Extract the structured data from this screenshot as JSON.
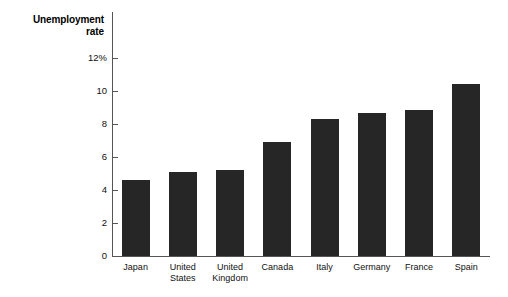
{
  "chart_data": {
    "type": "bar",
    "title": "Unemployment rate",
    "title_lines": "Unemployment\nrate",
    "xlabel": "",
    "ylabel": "Unemployment rate",
    "unit": "%",
    "grid": false,
    "legend": "none",
    "ylim": [
      0,
      12
    ],
    "ytick_values": [
      12,
      10,
      8,
      6,
      4,
      2,
      0
    ],
    "ytick_labels": [
      "12%",
      "10",
      "8",
      "6",
      "4",
      "2",
      "0"
    ],
    "categories": [
      "Japan",
      "United States",
      "United Kingdom",
      "Canada",
      "Italy",
      "Germany",
      "France",
      "Spain"
    ],
    "category_label_lines": [
      "Japan",
      "United\nStates",
      "United\nKingdom",
      "Canada",
      "Italy",
      "Germany",
      "France",
      "Spain"
    ],
    "values": [
      4.6,
      5.1,
      5.2,
      6.9,
      8.3,
      8.65,
      8.85,
      10.4
    ],
    "bar_color": "#262626",
    "axis_color": "#555555",
    "background_color": "#ffffff"
  }
}
